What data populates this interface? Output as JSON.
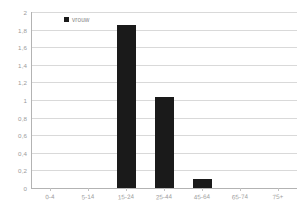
{
  "chart_data": {
    "type": "bar",
    "title": "",
    "subtitle": "",
    "xlabel": "",
    "ylabel": "",
    "categories": [
      "0-4",
      "5-14",
      "15-24",
      "25-44",
      "45-64",
      "65-74",
      "75+"
    ],
    "series": [
      {
        "name": "vrouw",
        "color": "#1a1a1a",
        "values": [
          0,
          0,
          1.85,
          1.03,
          0.1,
          0,
          0
        ]
      }
    ],
    "ylim": [
      0,
      2
    ],
    "ytick_values": [
      0,
      0.2,
      0.4,
      0.6,
      0.8,
      1,
      1.2,
      1.4,
      1.6,
      1.8,
      2
    ],
    "ytick_labels": [
      "0",
      "0,2",
      "0,4",
      "0,6",
      "0,8",
      "1",
      "1,2",
      "1,4",
      "1,6",
      "1,8",
      "2"
    ],
    "grid": true,
    "grid_axis": "y",
    "legend": {
      "position": "top-left-inside",
      "entries": [
        {
          "label": "vrouw",
          "marker": "square",
          "color": "#1a1a1a"
        }
      ]
    }
  },
  "style": {
    "background": "#ffffff",
    "gridline_color": "#d9d9d9",
    "axis_color": "#b3b3b3",
    "tick_text_color": "#9a9a9a",
    "bar_color": "#1a1a1a"
  }
}
